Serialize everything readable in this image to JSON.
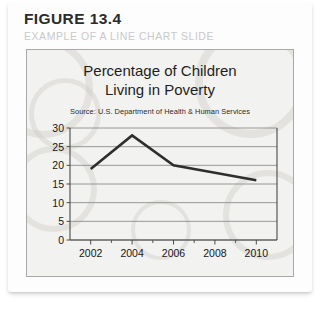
{
  "figure": {
    "number": "FIGURE 13.4",
    "caption": "EXAMPLE OF A LINE CHART SLIDE"
  },
  "slide": {
    "title_line1": "Percentage of Children",
    "title_line2": "Living in Poverty",
    "source": "Source: U.S. Department of Health & Human Services"
  },
  "colors": {
    "line": "#2e2e2e",
    "grid": "#8d8d8d",
    "axis": "#4a4a4a",
    "slide_bg": "#f2f2f1",
    "caption": "#c9c9c9"
  },
  "chart_data": {
    "type": "line",
    "title": "Percentage of Children Living in Poverty",
    "subtitle": "Source: U.S. Department of Health & Human Services",
    "xlabel": "",
    "ylabel": "",
    "x": [
      2002,
      2004,
      2006,
      2008,
      2010
    ],
    "series": [
      {
        "name": "Percentage of children living in poverty",
        "values": [
          19,
          28,
          20,
          18,
          16
        ]
      }
    ],
    "xlim": [
      2001,
      2011
    ],
    "ylim": [
      0,
      30
    ],
    "yticks": [
      0,
      5,
      10,
      15,
      20,
      25,
      30
    ],
    "ytick_labels": [
      "0",
      "5",
      "10",
      "15",
      "20",
      "25",
      "30"
    ],
    "xticks": [
      2002,
      2004,
      2006,
      2008,
      2010
    ],
    "xtick_labels": [
      "2002",
      "2004",
      "2006",
      "2008",
      "2010"
    ],
    "x_minor_ticks": [
      2003,
      2005,
      2007,
      2009
    ],
    "grid": "horizontal",
    "legend": "none"
  }
}
